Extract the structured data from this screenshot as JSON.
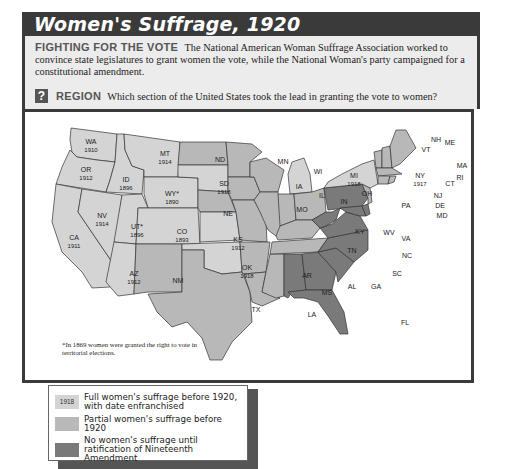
{
  "title": "Women's Suffrage, 1920",
  "caption": {
    "lead": "FIGHTING FOR THE VOTE",
    "text": "The National American Woman Suffrage Association worked to convince state legislatures to grant women the vote, while the National Woman's party campaigned for a constitutional amendment."
  },
  "question": {
    "icon": "?",
    "lead": "REGION",
    "text": "Which section of the United States took the lead in granting the vote to women?"
  },
  "footnote": "*In 1869 women were granted the right to vote in territorial elections.",
  "colors": {
    "full": "#d4d4d4",
    "partial": "#b8b8b8",
    "none": "#7a7a7a",
    "frame": "#3a3a3a"
  },
  "legend": {
    "items": [
      {
        "swatch_label": "1918",
        "label": "Full women's suffrage before 1920, with date enfranchised",
        "category": "full"
      },
      {
        "swatch_label": "",
        "label": "Partial women's suffrage before 1920",
        "category": "partial"
      },
      {
        "swatch_label": "",
        "label": "No women's suffrage until ratification of Nineteenth Amendment",
        "category": "none"
      }
    ]
  },
  "states": [
    {
      "abbr": "WA",
      "year": "1910",
      "category": "full"
    },
    {
      "abbr": "OR",
      "year": "1912",
      "category": "full"
    },
    {
      "abbr": "CA",
      "year": "1911",
      "category": "full"
    },
    {
      "abbr": "ID",
      "year": "1896",
      "category": "full"
    },
    {
      "abbr": "NV",
      "year": "1914",
      "category": "full"
    },
    {
      "abbr": "MT",
      "year": "1914",
      "category": "full"
    },
    {
      "abbr": "WY*",
      "year": "1890",
      "category": "full"
    },
    {
      "abbr": "UT*",
      "year": "1896",
      "category": "full"
    },
    {
      "abbr": "AZ",
      "year": "1912",
      "category": "full"
    },
    {
      "abbr": "CO",
      "year": "1893",
      "category": "full"
    },
    {
      "abbr": "NM",
      "year": "",
      "category": "partial"
    },
    {
      "abbr": "ND",
      "year": "",
      "category": "partial"
    },
    {
      "abbr": "SD",
      "year": "1918",
      "category": "full"
    },
    {
      "abbr": "NE",
      "year": "",
      "category": "partial"
    },
    {
      "abbr": "KS",
      "year": "1912",
      "category": "full"
    },
    {
      "abbr": "OK",
      "year": "1918",
      "category": "full"
    },
    {
      "abbr": "TX",
      "year": "",
      "category": "partial"
    },
    {
      "abbr": "MN",
      "year": "",
      "category": "partial"
    },
    {
      "abbr": "IA",
      "year": "",
      "category": "partial"
    },
    {
      "abbr": "MO",
      "year": "",
      "category": "partial"
    },
    {
      "abbr": "AR",
      "year": "",
      "category": "partial"
    },
    {
      "abbr": "LA",
      "year": "",
      "category": "partial"
    },
    {
      "abbr": "WI",
      "year": "",
      "category": "partial"
    },
    {
      "abbr": "IL",
      "year": "",
      "category": "partial"
    },
    {
      "abbr": "MI",
      "year": "1918",
      "category": "full"
    },
    {
      "abbr": "IN",
      "year": "",
      "category": "partial"
    },
    {
      "abbr": "OH",
      "year": "",
      "category": "partial"
    },
    {
      "abbr": "KY",
      "year": "",
      "category": "partial"
    },
    {
      "abbr": "TN",
      "year": "",
      "category": "partial"
    },
    {
      "abbr": "MS",
      "year": "",
      "category": "partial"
    },
    {
      "abbr": "AL",
      "year": "",
      "category": "none"
    },
    {
      "abbr": "GA",
      "year": "",
      "category": "none"
    },
    {
      "abbr": "FL",
      "year": "",
      "category": "none"
    },
    {
      "abbr": "SC",
      "year": "",
      "category": "none"
    },
    {
      "abbr": "NC",
      "year": "",
      "category": "none"
    },
    {
      "abbr": "VA",
      "year": "",
      "category": "none"
    },
    {
      "abbr": "WV",
      "year": "",
      "category": "none"
    },
    {
      "abbr": "PA",
      "year": "",
      "category": "none"
    },
    {
      "abbr": "MD",
      "year": "",
      "category": "none"
    },
    {
      "abbr": "DE",
      "year": "",
      "category": "none"
    },
    {
      "abbr": "NY",
      "year": "1917",
      "category": "full"
    },
    {
      "abbr": "NJ",
      "year": "",
      "category": "partial"
    },
    {
      "abbr": "CT",
      "year": "",
      "category": "partial"
    },
    {
      "abbr": "RI",
      "year": "",
      "category": "partial"
    },
    {
      "abbr": "MA",
      "year": "",
      "category": "partial"
    },
    {
      "abbr": "VT",
      "year": "",
      "category": "partial"
    },
    {
      "abbr": "NH",
      "year": "",
      "category": "partial"
    },
    {
      "abbr": "ME",
      "year": "",
      "category": "partial"
    }
  ]
}
